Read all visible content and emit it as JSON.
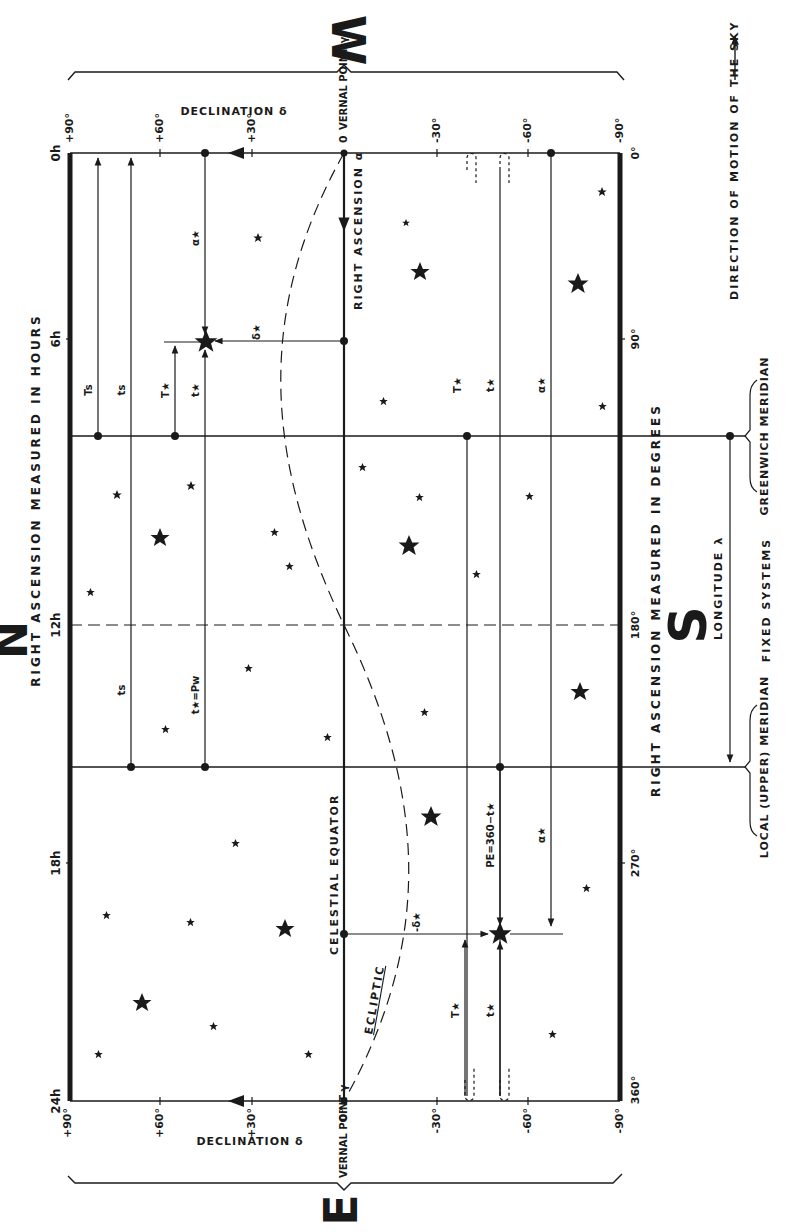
{
  "diagram": {
    "orientation": "rotated 90deg clockwise (text reads bottom-to-top)",
    "compass": {
      "north": "N",
      "south": "S",
      "east": "E",
      "west": "W"
    },
    "top_axis": {
      "title": "RIGHT ASCENSION MEASURED IN HOURS",
      "ticks": [
        "0h",
        "6h",
        "12h",
        "18h",
        "24h"
      ]
    },
    "bottom_axis": {
      "title": "RIGHT ASCENSION MEASURED IN DEGREES",
      "ticks": [
        "0°",
        "90°",
        "180°",
        "270°",
        "360°"
      ]
    },
    "declination_axis": {
      "title": "DECLINATION δ",
      "ticks": [
        "+90°",
        "+60°",
        "+30°",
        "0",
        "-30°",
        "-60°",
        "-90°"
      ]
    },
    "bottom_declination_ticks": [
      "+90°",
      "+60°",
      "+30°",
      "0°",
      "-30°",
      "-60°",
      "-90°"
    ],
    "vernal_point": "VERNAL POINT γ",
    "celestial_equator": "CELESTIAL EQUATOR",
    "ecliptic": "ECLIPTIC",
    "right_ascension_alpha": "RIGHT ASCENSION α",
    "longitude": "LONGITUDE λ",
    "fixed_systems": "FIXED SYSTEMS",
    "greenwich_meridian": "GREENWICH MERIDIAN",
    "local_meridian": "LOCAL (UPPER) MERIDIAN",
    "motion_direction": "DIRECTION OF MOTION OF THE SKY",
    "symbols": {
      "T_s": "Ts",
      "t_s": "ts",
      "T_star": "T★",
      "t_star": "t★",
      "alpha_star": "α★",
      "delta_star": "δ★",
      "minus_delta_star": "-δ★",
      "t_star_eq_pw": "t★=Pw",
      "pe_eq": "PE=360−t★"
    }
  }
}
